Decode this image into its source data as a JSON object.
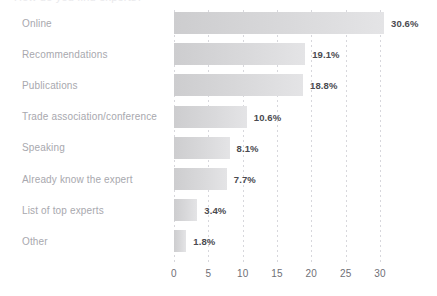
{
  "clipped_top_text": "How do you find experts?",
  "chart_data": {
    "type": "bar",
    "orientation": "horizontal",
    "title": "",
    "xlabel": "",
    "ylabel": "",
    "xlim": [
      0,
      30
    ],
    "grid": true,
    "legend": false,
    "categories": [
      "Online",
      "Recommendations",
      "Publications",
      "Trade association/conference",
      "Speaking",
      "Already know the expert",
      "List of top experts",
      "Other"
    ],
    "values": [
      30.6,
      19.1,
      18.8,
      10.6,
      8.1,
      7.7,
      3.4,
      1.8
    ],
    "value_labels": [
      "30.6%",
      "19.1%",
      "18.8%",
      "10.6%",
      "8.1%",
      "7.7%",
      "3.4%",
      "1.8%"
    ],
    "xticks": [
      0,
      5,
      10,
      15,
      20,
      25,
      30
    ],
    "xtick_labels": [
      "0",
      "5",
      "10",
      "15",
      "20",
      "25",
      "30"
    ],
    "colors": {
      "bar_start": "#cdcdcf",
      "bar_end": "#e4e4e6",
      "value_label": "#4a4a50",
      "category_label": "#a8a8ae",
      "tick_label": "#6f6f76",
      "gridline": "#d7d7dc",
      "background": "#ffffff"
    }
  }
}
